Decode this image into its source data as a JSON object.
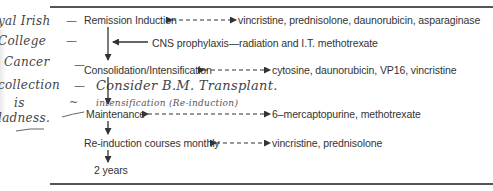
{
  "document": {
    "type": "treatment-schedule-flowchart",
    "steps": [
      {
        "label": "Remission Induction",
        "drugs": "vincristine, prednisolone, daunorubicin, asparaginase",
        "link": "bidirectional-dashed"
      },
      {
        "label": "CNS prophylaxis—radiation and I.T. methotrexate",
        "drugs": "",
        "link": "arrow-into-main-flow"
      },
      {
        "label": "Consolidation/Intensification",
        "drugs": "cytosine, daunorubicin, VP16, vincristine",
        "link": "bidirectional-dashed"
      },
      {
        "label": "Maintenance",
        "drugs": "6–mercaptopurine, methotrexate",
        "link": "bidirectional-dashed"
      },
      {
        "label": "Re-induction courses monthly",
        "drugs": "vincristine, prednisolone",
        "link": "bidirectional-dashed"
      },
      {
        "label": "2 years",
        "drugs": "",
        "link": "none"
      }
    ]
  },
  "handwriting": {
    "margin_notes": [
      {
        "text": "yal Irish",
        "dash": "—"
      },
      {
        "text": "College",
        "dash": "—"
      },
      {
        "text": "Cancer",
        "dash": "—"
      },
      {
        "text": "collection",
        "dash": "—"
      },
      {
        "text": "is",
        "dash": "~"
      },
      {
        "text": "ladness.",
        "dash": "—"
      }
    ],
    "inline_notes": [
      {
        "text": "Consider B.M. Transplant."
      },
      {
        "text": "intensification (Re-induction)"
      }
    ]
  },
  "colors": {
    "ink_print": "#333333",
    "ink_hand": "#444444",
    "rule": "#555555",
    "background": "#ffffff"
  }
}
